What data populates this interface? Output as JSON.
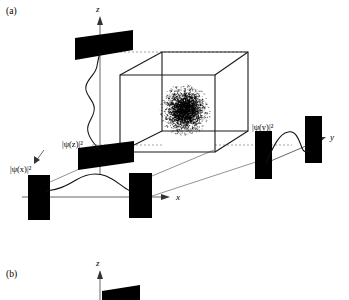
{
  "figure": {
    "panels": [
      {
        "id": "a",
        "label": "(a)"
      },
      {
        "id": "b",
        "label": "(b)"
      }
    ],
    "axes": {
      "x": "x",
      "y": "y",
      "z": "z",
      "z_panel_b": "z"
    },
    "wavefunction_labels": {
      "x": "|ψ(x)|²",
      "y": "|ψ(y)|²",
      "z": "|ψ(z)|²"
    },
    "colors": {
      "ink": "#000000",
      "cube_edge": "#1a1a1a",
      "dashed_projection": "#9a9a9a",
      "axis": "#555555",
      "wave": "#111111",
      "background": "#ffffff"
    },
    "elements": {
      "cube_name": "3d-trap-box",
      "cloud_name": "particle-cloud",
      "barrier_name": "potential-barrier-slab"
    }
  },
  "chart_data": {
    "type": "line",
    "title": "",
    "series": [
      {
        "name": "|ψ(x)|²",
        "axis": "x",
        "orientation": "horizontal",
        "peaks": 1,
        "x": [
          0,
          0.1,
          0.2,
          0.3,
          0.4,
          0.5,
          0.6,
          0.7,
          0.8,
          0.9,
          1.0
        ],
        "values": [
          0.02,
          0.06,
          0.22,
          0.52,
          0.82,
          0.95,
          0.8,
          0.48,
          0.2,
          0.06,
          0.02
        ]
      },
      {
        "name": "|ψ(y)|²",
        "axis": "y",
        "orientation": "horizontal",
        "peaks": 2,
        "x": [
          0,
          0.12,
          0.24,
          0.36,
          0.48,
          0.6,
          0.72,
          0.84,
          1.0
        ],
        "values": [
          0.02,
          0.35,
          0.88,
          0.95,
          0.5,
          0.08,
          -0.3,
          -0.18,
          0.02
        ]
      },
      {
        "name": "|ψ(z)|²",
        "axis": "z",
        "orientation": "vertical",
        "peaks": 2,
        "x": [
          0,
          0.14,
          0.28,
          0.42,
          0.56,
          0.7,
          0.84,
          1.0
        ],
        "values": [
          0.02,
          0.3,
          0.12,
          0.45,
          0.3,
          0.55,
          0.2,
          0.02
        ]
      }
    ],
    "grid": false,
    "legend": "none"
  }
}
